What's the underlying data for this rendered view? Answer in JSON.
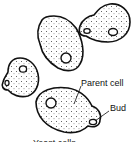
{
  "diagram": {
    "labels": {
      "parent_cell": "Parent cell",
      "bud": "Bud"
    },
    "caption": "Yeast cells"
  }
}
